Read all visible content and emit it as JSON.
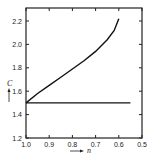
{
  "chart_data": {
    "type": "line",
    "title": "",
    "xlabel": "n",
    "ylabel": "C",
    "xlim": [
      1.0,
      0.5
    ],
    "ylim": [
      1.2,
      2.3
    ],
    "x_reversed": true,
    "grid": false,
    "legend": null,
    "x_ticks": [
      1.0,
      0.9,
      0.8,
      0.7,
      0.6,
      0.5
    ],
    "x_tick_labels": [
      "1.0",
      "0.9",
      "0.8",
      "0.7",
      "0.6",
      "0.5"
    ],
    "y_ticks": [
      1.2,
      1.4,
      1.6,
      1.8,
      2.0,
      2.2
    ],
    "y_tick_labels": [
      "1.2",
      "1.4",
      "1.6",
      "1.8",
      "2.0",
      "2.2"
    ],
    "series": [
      {
        "name": "curve",
        "x": [
          1.0,
          0.95,
          0.9,
          0.85,
          0.8,
          0.75,
          0.7,
          0.65,
          0.62,
          0.6
        ],
        "y": [
          1.5,
          1.58,
          1.65,
          1.72,
          1.79,
          1.86,
          1.94,
          2.04,
          2.12,
          2.22
        ]
      },
      {
        "name": "constant",
        "x": [
          1.0,
          0.55
        ],
        "y": [
          1.5,
          1.5
        ]
      }
    ]
  }
}
